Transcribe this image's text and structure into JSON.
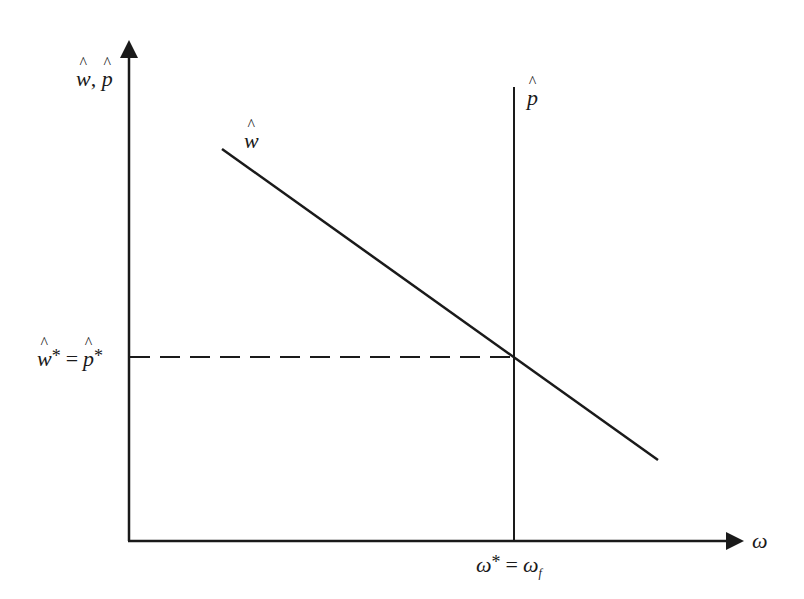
{
  "diagram": {
    "type": "economics-equilibrium",
    "y_axis": {
      "label_parts": [
        "w",
        ",",
        "p"
      ],
      "label": "ŵ, p̂"
    },
    "x_axis": {
      "label": "ω"
    },
    "curves": [
      {
        "name": "w-hat",
        "label": "ŵ",
        "symbol": "w",
        "kind": "downward-sloping line",
        "from": [
          222,
          149
        ],
        "to": [
          658,
          460
        ]
      },
      {
        "name": "p-hat",
        "label": "p̂",
        "symbol": "p",
        "kind": "vertical line",
        "x": 514,
        "from_y": 87,
        "to_y": 541
      }
    ],
    "equilibrium": {
      "y_label": "ŵ* = p̂*",
      "y_label_parts": {
        "lhs": "w",
        "star": "*",
        "eq": "=",
        "rhs": "p",
        "star2": "*"
      },
      "x_label": "ω* = ω_f",
      "x_label_parts": {
        "lhs": "ω",
        "star": "*",
        "eq": "=",
        "rhs": "ω",
        "sub": "f"
      },
      "point": [
        514,
        357
      ],
      "guide": "dashed horizontal line from y-axis to intersection"
    },
    "colors": {
      "line": "#1a1a1a",
      "background": "#ffffff"
    }
  }
}
